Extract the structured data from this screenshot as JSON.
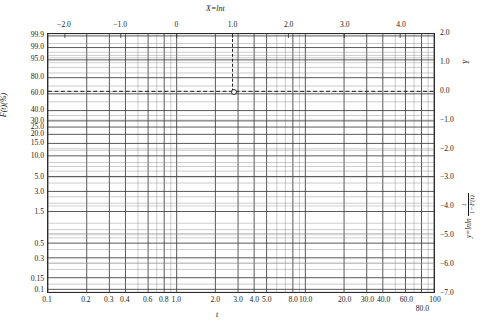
{
  "chart_data": {
    "type": "line",
    "title": "",
    "subtitle": "",
    "paper_type": "Weibull probability paper",
    "grid": true,
    "legend": null,
    "axes": {
      "bottom": {
        "label": "t",
        "scale": "log10",
        "range": [
          0.1,
          100
        ],
        "ticks": [
          0.1,
          0.2,
          0.3,
          0.4,
          0.6,
          0.8,
          1.0,
          2.0,
          3.0,
          4.0,
          5.0,
          8.0,
          10.0,
          20.0,
          30.0,
          40.0,
          60.0,
          80.0,
          100
        ],
        "tick_labels": [
          "0.1",
          "0.2",
          "0.3",
          "0.4",
          "0.6",
          "0.8",
          "1.0",
          "2.0",
          "3.0",
          "4.0",
          "5.0",
          "8.0",
          "10.0",
          "20.0",
          "30.0",
          "40.0",
          "60.0",
          "80.0",
          "100"
        ]
      },
      "top": {
        "label": "X=lnt",
        "scale": "linear",
        "range": [
          -2.302585,
          4.60517
        ],
        "ticks": [
          -2.0,
          -1.0,
          0,
          1.0,
          2.0,
          3.0,
          4.0
        ],
        "tick_labels": [
          "−2.0",
          "−1.0",
          "0",
          "1.0",
          "2.0",
          "3.0",
          "4.0"
        ]
      },
      "left": {
        "label": "F(t)(%)",
        "scale": "weibull-lnln",
        "range": [
          0.1,
          99.9
        ],
        "ticks": [
          99.9,
          99.0,
          95.0,
          80.0,
          60.0,
          40.0,
          30.0,
          25.0,
          20.0,
          15.0,
          10.0,
          5.0,
          3.0,
          1.5,
          0.5,
          0.3,
          0.15,
          0.1
        ],
        "tick_labels": [
          "99.9",
          "99.0",
          "95.0",
          "80.0",
          "60.0",
          "40.0",
          "30.0",
          "25.0",
          "20.0",
          "15.0",
          "10.0",
          "5.0",
          "3.0",
          "1.5",
          "0.5",
          "0.3",
          "0.15",
          "0.1"
        ]
      },
      "right": {
        "label": "Y",
        "formula_num": "1",
        "formula_den": "1−F(t)",
        "formula_prefix": "y=lnln",
        "scale": "linear",
        "range": [
          -7.0,
          2.0
        ],
        "ticks": [
          2.0,
          1.0,
          0.0,
          -1.0,
          -2.0,
          -3.0,
          -4.0,
          -5.0,
          -6.0,
          -7.0
        ],
        "tick_labels": [
          "2.0",
          "1.0",
          "0.0",
          "−1.0",
          "−2.0",
          "−3.0",
          "−4.0",
          "−5.0",
          "−6.0",
          "−7.0"
        ]
      }
    },
    "annotations": [
      {
        "name": "characteristic-life-point",
        "marker": "open-circle",
        "x_lnt": 1.0,
        "t": 2.718,
        "F_percent": 63.2,
        "y_value": 0.0,
        "guide_lines": [
          "vertical-dashed",
          "horizontal-dashed"
        ]
      }
    ],
    "series": [],
    "colors": {
      "grid_major": "#3a3a3a",
      "grid_minor": "#8a8a8a",
      "frame": "#2b2b2b",
      "guide_dash": "#1a1a1a",
      "background": "#ffffff"
    }
  }
}
